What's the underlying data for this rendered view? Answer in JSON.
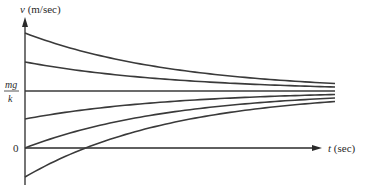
{
  "figure": {
    "y_axis_label": {
      "var": "v",
      "unit": " (m/sec)"
    },
    "x_axis_label": {
      "var": "t",
      "unit": " (sec)"
    },
    "equilibrium_label": {
      "numerator": "mg",
      "denominator": "k"
    },
    "zero_label": "0"
  },
  "colors": {
    "ink": "#2a2a2a",
    "curve": "#3a3a3a",
    "background": "#ffffff"
  },
  "curves": [
    {
      "name": "solution-above-2",
      "start_y": 33,
      "mid_y": 60.7,
      "q_y": 74,
      "end_y": 83.5
    },
    {
      "name": "solution-above-1",
      "start_y": 62,
      "mid_y": 76,
      "q_y": 81.7,
      "end_y": 87
    },
    {
      "name": "equilibrium",
      "start_y": 91,
      "mid_y": 91,
      "q_y": 91,
      "end_y": 91
    },
    {
      "name": "solution-below-1",
      "start_y": 119,
      "mid_y": 107.7,
      "q_y": 101,
      "end_y": 94.5
    },
    {
      "name": "solution-below-2",
      "start_y": 148,
      "mid_y": 121.7,
      "q_y": 107,
      "end_y": 98
    },
    {
      "name": "solution-below-3",
      "start_y": 177,
      "mid_y": 138,
      "q_y": 115,
      "end_y": 101.5
    }
  ]
}
